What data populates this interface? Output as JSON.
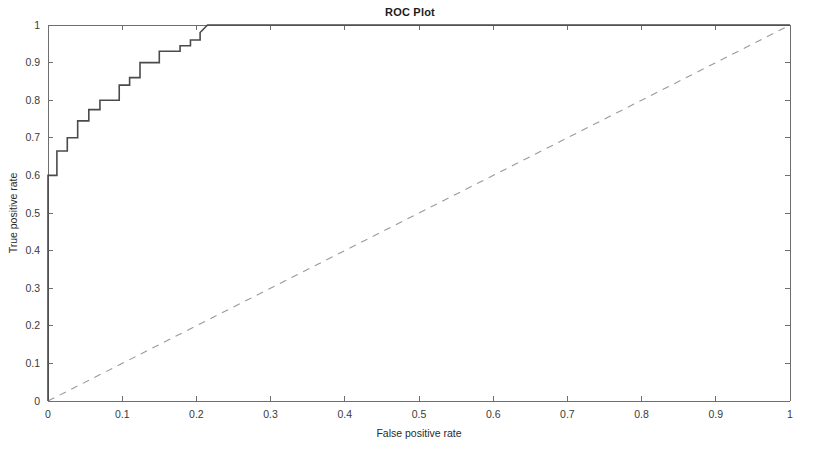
{
  "chart_data": {
    "type": "line",
    "title": "ROC Plot",
    "xlabel": "False positive rate",
    "ylabel": "True positive rate",
    "xlim": [
      0,
      1
    ],
    "ylim": [
      0,
      1
    ],
    "grid": false,
    "legend": null,
    "xticks": [
      "0",
      "0.1",
      "0.2",
      "0.3",
      "0.4",
      "0.5",
      "0.6",
      "0.7",
      "0.8",
      "0.9",
      "1"
    ],
    "xtick_values": [
      0,
      0.1,
      0.2,
      0.3,
      0.4,
      0.5,
      0.6,
      0.7,
      0.8,
      0.9,
      1
    ],
    "yticks": [
      "0",
      "0.1",
      "0.2",
      "0.3",
      "0.4",
      "0.5",
      "0.6",
      "0.7",
      "0.8",
      "0.9",
      "1"
    ],
    "ytick_values": [
      0,
      0.1,
      0.2,
      0.3,
      0.4,
      0.5,
      0.6,
      0.7,
      0.8,
      0.9,
      1
    ],
    "series": [
      {
        "name": "ROC curve",
        "style": "solid",
        "color": "#4a4a4a",
        "x": [
          0,
          0,
          0.012,
          0.012,
          0.026,
          0.026,
          0.04,
          0.04,
          0.055,
          0.055,
          0.07,
          0.07,
          0.096,
          0.096,
          0.11,
          0.11,
          0.124,
          0.124,
          0.15,
          0.15,
          0.178,
          0.178,
          0.192,
          0.192,
          0.205,
          0.205,
          0.215,
          1
        ],
        "y": [
          0,
          0.6,
          0.6,
          0.665,
          0.665,
          0.7,
          0.7,
          0.745,
          0.745,
          0.775,
          0.775,
          0.8,
          0.8,
          0.84,
          0.84,
          0.86,
          0.86,
          0.9,
          0.9,
          0.93,
          0.93,
          0.945,
          0.945,
          0.96,
          0.96,
          0.98,
          1.0,
          1.0
        ]
      },
      {
        "name": "Chance line",
        "style": "dashed",
        "color": "#9a9a9a",
        "x": [
          0,
          1
        ],
        "y": [
          0,
          1
        ]
      }
    ]
  },
  "figure": {
    "background_color": "#ffffff",
    "axis_color": "#6e6e6e"
  }
}
